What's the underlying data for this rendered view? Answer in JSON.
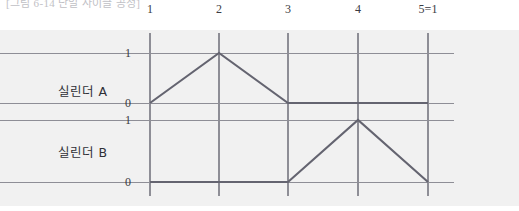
{
  "caption": {
    "text": "[그림 6-14 단일 사이클 공정]",
    "clipped": true
  },
  "chart_data": {
    "type": "line",
    "title": "",
    "xlabel": "",
    "ylabel": "",
    "grid": true,
    "legend": "none",
    "x_tick_labels": [
      "1",
      "2",
      "3",
      "4",
      "5=1"
    ],
    "x_tick_values": [
      1,
      2,
      3,
      4,
      5
    ],
    "xlim": [
      1,
      5
    ],
    "ylim": [
      0,
      1
    ],
    "y_tick_labels_a": [
      "0",
      "1"
    ],
    "y_tick_labels_b": [
      "0",
      "1"
    ],
    "series": [
      {
        "name": "실린더 A",
        "x": [
          1,
          2,
          3,
          4,
          5
        ],
        "values": [
          0,
          1,
          0,
          0,
          0
        ]
      },
      {
        "name": "실린더 B",
        "x": [
          1,
          2,
          3,
          4,
          5
        ],
        "values": [
          0,
          0,
          0,
          1,
          0
        ]
      }
    ]
  },
  "colors": {
    "panel": "#f1f1f1",
    "grid": "#8e8e96",
    "trace": "#646470",
    "text": "#3b3b42"
  },
  "geometry": {
    "x_px": [
      150,
      219,
      288,
      358,
      428
    ],
    "grid_right_px": 454,
    "a_one_px": 53,
    "a_zero_px": 103,
    "b_one_px": 120,
    "b_zero_px": 182,
    "label_a_px": 90,
    "label_b_px": 151,
    "ylabel_right_px": 131,
    "rowlabel_right_px": 107
  }
}
